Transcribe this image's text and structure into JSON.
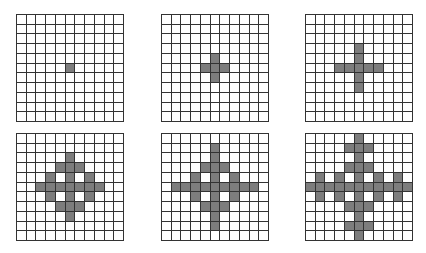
{
  "figure": {
    "grid_size": 11,
    "fill_color": "#7d7d7d",
    "line_color": "#333333",
    "panels": [
      {
        "id": "panel-1",
        "x": 16,
        "y": 14,
        "cells": [
          [
            5,
            5
          ]
        ]
      },
      {
        "id": "panel-2",
        "x": 161,
        "y": 14,
        "cells": [
          [
            4,
            5
          ],
          [
            5,
            4
          ],
          [
            5,
            5
          ],
          [
            5,
            6
          ],
          [
            6,
            5
          ]
        ]
      },
      {
        "id": "panel-3",
        "x": 305,
        "y": 14,
        "cells": [
          [
            3,
            5
          ],
          [
            4,
            5
          ],
          [
            5,
            3
          ],
          [
            5,
            4
          ],
          [
            5,
            5
          ],
          [
            5,
            6
          ],
          [
            5,
            7
          ],
          [
            6,
            5
          ],
          [
            7,
            5
          ]
        ]
      },
      {
        "id": "panel-4",
        "x": 16,
        "y": 133,
        "cells": [
          [
            2,
            5
          ],
          [
            3,
            4
          ],
          [
            3,
            5
          ],
          [
            3,
            6
          ],
          [
            4,
            3
          ],
          [
            4,
            5
          ],
          [
            4,
            7
          ],
          [
            5,
            2
          ],
          [
            5,
            3
          ],
          [
            5,
            4
          ],
          [
            5,
            5
          ],
          [
            5,
            6
          ],
          [
            5,
            7
          ],
          [
            5,
            8
          ],
          [
            6,
            3
          ],
          [
            6,
            5
          ],
          [
            6,
            7
          ],
          [
            7,
            4
          ],
          [
            7,
            5
          ],
          [
            7,
            6
          ],
          [
            8,
            5
          ]
        ]
      },
      {
        "id": "panel-5",
        "x": 161,
        "y": 133,
        "cells": [
          [
            1,
            5
          ],
          [
            2,
            5
          ],
          [
            3,
            4
          ],
          [
            3,
            5
          ],
          [
            3,
            6
          ],
          [
            4,
            3
          ],
          [
            4,
            5
          ],
          [
            4,
            7
          ],
          [
            5,
            1
          ],
          [
            5,
            2
          ],
          [
            5,
            3
          ],
          [
            5,
            4
          ],
          [
            5,
            5
          ],
          [
            5,
            6
          ],
          [
            5,
            7
          ],
          [
            5,
            8
          ],
          [
            5,
            9
          ],
          [
            6,
            3
          ],
          [
            6,
            5
          ],
          [
            6,
            7
          ],
          [
            7,
            4
          ],
          [
            7,
            5
          ],
          [
            7,
            6
          ],
          [
            8,
            5
          ],
          [
            9,
            5
          ]
        ]
      },
      {
        "id": "panel-6",
        "x": 305,
        "y": 133,
        "cells": [
          [
            0,
            5
          ],
          [
            1,
            4
          ],
          [
            1,
            5
          ],
          [
            1,
            6
          ],
          [
            2,
            5
          ],
          [
            3,
            4
          ],
          [
            3,
            5
          ],
          [
            3,
            6
          ],
          [
            4,
            1
          ],
          [
            4,
            3
          ],
          [
            4,
            5
          ],
          [
            4,
            7
          ],
          [
            4,
            9
          ],
          [
            5,
            0
          ],
          [
            5,
            1
          ],
          [
            5,
            2
          ],
          [
            5,
            3
          ],
          [
            5,
            4
          ],
          [
            5,
            5
          ],
          [
            5,
            6
          ],
          [
            5,
            7
          ],
          [
            5,
            8
          ],
          [
            5,
            9
          ],
          [
            5,
            10
          ],
          [
            6,
            1
          ],
          [
            6,
            3
          ],
          [
            6,
            5
          ],
          [
            6,
            7
          ],
          [
            6,
            9
          ],
          [
            7,
            4
          ],
          [
            7,
            5
          ],
          [
            7,
            6
          ],
          [
            8,
            5
          ],
          [
            9,
            4
          ],
          [
            9,
            5
          ],
          [
            9,
            6
          ],
          [
            10,
            5
          ]
        ]
      }
    ]
  }
}
